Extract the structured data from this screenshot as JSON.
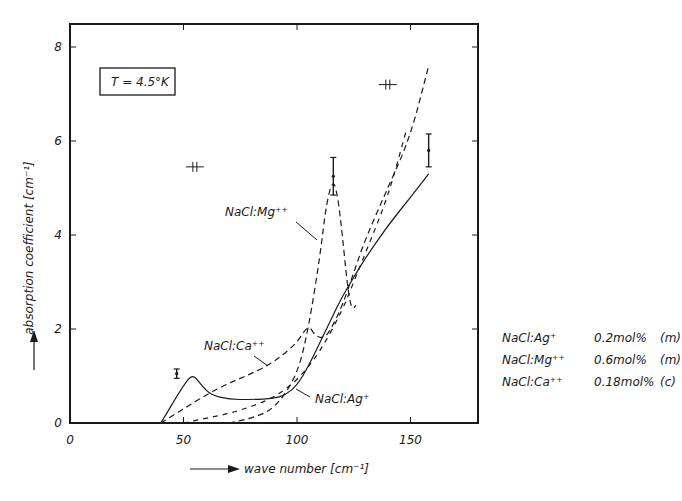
{
  "chart_data": {
    "type": "line",
    "title": "",
    "xlabel": "wave number [cm⁻¹]",
    "ylabel": "absorption coefficient [cm⁻¹]",
    "xlim": [
      0,
      180
    ],
    "ylim": [
      0,
      8.5
    ],
    "x_ticks": [
      "0",
      "50",
      "100",
      "150"
    ],
    "y_ticks": [
      "0",
      "2",
      "4",
      "6",
      "8"
    ],
    "grid": false,
    "annotation_box": "T = 4.5°K",
    "series": [
      {
        "name": "NaCl:Ag⁺",
        "style": "solid",
        "x": [
          40,
          45,
          50,
          54,
          58,
          62,
          70,
          80,
          90,
          95,
          100,
          105,
          110,
          115,
          120,
          125,
          130,
          140,
          150,
          158
        ],
        "y": [
          0.0,
          0.4,
          0.8,
          1.05,
          0.8,
          0.6,
          0.5,
          0.5,
          0.52,
          0.6,
          0.8,
          1.2,
          1.7,
          2.2,
          2.7,
          3.1,
          3.5,
          4.2,
          4.8,
          5.3
        ]
      },
      {
        "name": "NaCl:Mg⁺⁺",
        "style": "dashed",
        "x": [
          70,
          80,
          90,
          100,
          105,
          110,
          113,
          116,
          118,
          120,
          122,
          124,
          126
        ],
        "y": [
          0.0,
          0.1,
          0.3,
          1.0,
          2.0,
          3.5,
          4.7,
          5.2,
          4.8,
          4.0,
          3.0,
          2.4,
          2.5
        ]
      },
      {
        "name": "NaCl:Ca⁺⁺",
        "style": "dashed",
        "x": [
          40,
          50,
          60,
          70,
          80,
          90,
          100,
          105,
          108,
          112,
          115,
          120,
          125,
          130,
          140,
          150,
          158
        ],
        "y": [
          0.0,
          0.3,
          0.6,
          0.85,
          1.05,
          1.3,
          1.7,
          2.1,
          1.85,
          1.8,
          2.0,
          2.5,
          3.2,
          3.9,
          5.0,
          6.1,
          7.6
        ]
      },
      {
        "name": "NaCl:Ag⁺ (second dashed branch)",
        "style": "dash-dot",
        "x": [
          50,
          60,
          70,
          80,
          90,
          100,
          110,
          120,
          125,
          130,
          140,
          148
        ],
        "y": [
          0.0,
          0.1,
          0.2,
          0.35,
          0.55,
          0.9,
          1.5,
          2.4,
          3.0,
          3.6,
          4.8,
          6.2
        ]
      }
    ],
    "error_bars": [
      {
        "x": 47,
        "y": 1.05,
        "err": 0.1
      },
      {
        "x": 116,
        "y": 5.25,
        "err": 0.4
      },
      {
        "x": 158,
        "y": 5.8,
        "err": 0.35
      }
    ],
    "resolution_marks": [
      {
        "x": 55,
        "y": 5.45
      },
      {
        "x": 140,
        "y": 7.2
      }
    ],
    "curve_labels": [
      {
        "text": "NaCl:Mg⁺⁺",
        "x": 72,
        "y": 4.5
      },
      {
        "text": "NaCl:Ca⁺⁺",
        "x": 50,
        "y": 1.45
      },
      {
        "text": "NaCl:Ag⁺",
        "x": 115,
        "y": 0.35
      }
    ]
  },
  "axes": {
    "x_label": "wave number [cm⁻¹]",
    "y_label": "absorption coefficient [cm⁻¹]",
    "x_ticks": [
      {
        "label": "0",
        "value": 0
      },
      {
        "label": "50",
        "value": 50
      },
      {
        "label": "100",
        "value": 100
      },
      {
        "label": "150",
        "value": 150
      }
    ],
    "y_ticks": [
      {
        "label": "0",
        "value": 0
      },
      {
        "label": "2",
        "value": 2
      },
      {
        "label": "4",
        "value": 4
      },
      {
        "label": "6",
        "value": 6
      },
      {
        "label": "8",
        "value": 8
      }
    ]
  },
  "annotation": {
    "temperature": "T = 4.5°K"
  },
  "curve_labels": {
    "mg": "NaCl:Mg⁺⁺",
    "ca": "NaCl:Ca⁺⁺",
    "ag": "NaCl:Ag⁺"
  },
  "legend": [
    {
      "name": "NaCl:Ag⁺",
      "conc": "0.2mol%",
      "method": "(m)"
    },
    {
      "name": "NaCl:Mg⁺⁺",
      "conc": "0.6mol%",
      "method": "(m)"
    },
    {
      "name": "NaCl:Ca⁺⁺",
      "conc": "0.18mol%",
      "method": "(c)"
    }
  ]
}
